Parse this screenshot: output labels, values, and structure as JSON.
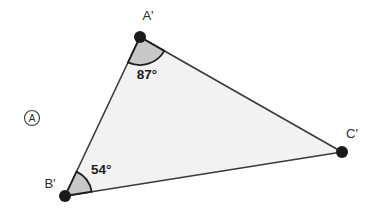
{
  "figure": {
    "panel_marker": "A",
    "background_color": "#ffffff",
    "triangle": {
      "fill_color": "#f2f2f2",
      "stroke_color": "#3a3a3a",
      "vertices": [
        {
          "id": "A-prime",
          "label": "A'",
          "x": 140,
          "y": 37,
          "label_x": 148,
          "label_y": 20
        },
        {
          "id": "B-prime",
          "label": "B'",
          "x": 65,
          "y": 196,
          "label_x": 50,
          "label_y": 188
        },
        {
          "id": "C-prime",
          "label": "C'",
          "x": 342,
          "y": 152,
          "label_x": 346,
          "label_y": 138
        }
      ],
      "vertex_dot_color": "#1a1a1a",
      "vertex_dot_radius": 6
    },
    "angles": [
      {
        "id": "angle-a-prime",
        "at_vertex": "A-prime",
        "value": "87°",
        "degrees": 87,
        "arc_fill": "#c8c8c8",
        "arc_stroke": "#1d1d1d",
        "arc_radius": 28,
        "label_x": 147,
        "label_y": 79
      },
      {
        "id": "angle-b-prime",
        "at_vertex": "B-prime",
        "value": "54°",
        "degrees": 54,
        "arc_fill": "#c8c8c8",
        "arc_stroke": "#1d1d1d",
        "arc_radius": 27,
        "label_x": 91,
        "label_y": 174
      }
    ],
    "panel_marker_circle": {
      "cx": 32,
      "cy": 118,
      "r": 7.5,
      "stroke_color": "#3a3a3a"
    }
  }
}
